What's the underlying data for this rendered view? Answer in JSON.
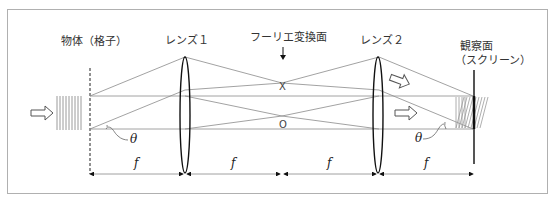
{
  "diagram": {
    "labels": {
      "object": "物体（格子）",
      "lens1": "レンズ１",
      "fourier_plane": "フーリエ変換面",
      "lens2": "レンズ２",
      "screen_line1": "観察面",
      "screen_line2": "（スクリーン）"
    },
    "points": {
      "x_point": "X",
      "o_point": "O"
    },
    "angle_symbol": "θ",
    "focal_symbol": "f",
    "dimension_segments": [
      "f",
      "f",
      "f",
      "f"
    ],
    "colors": {
      "frame": "#b0b0b0",
      "ray": "#8a8a8a",
      "lens": "#111111",
      "text": "#333333",
      "screen": "#555555"
    }
  }
}
